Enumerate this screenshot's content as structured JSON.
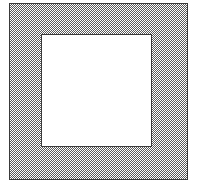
{
  "figure": {
    "description": "A large square filled with a 50% checkerboard dither pattern, containing a smaller unfilled white square, forming a square ring or frame.",
    "canvas": {
      "width": 197,
      "height": 186,
      "background_color": "#ffffff"
    },
    "shapes": [
      {
        "name": "outer-square",
        "kind": "square",
        "fill": "dither-checkerboard-50",
        "fill_color": "#5a5a5a",
        "stroke_color": "#3a3a3a",
        "stroke_width": 1,
        "x": 9,
        "y": 3,
        "width": 179,
        "height": 177
      },
      {
        "name": "inner-square",
        "kind": "square",
        "fill": "solid",
        "fill_color": "#ffffff",
        "stroke_color": "#3a3a3a",
        "stroke_width": 1,
        "x": 41,
        "y": 34,
        "width": 111,
        "height": 113
      }
    ]
  }
}
